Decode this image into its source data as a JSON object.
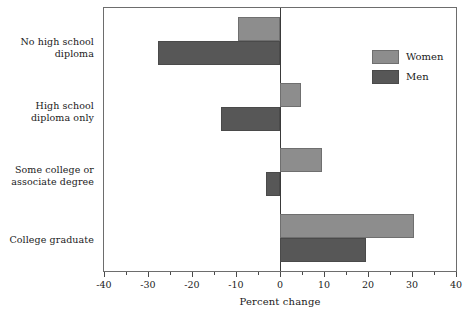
{
  "chart_data": {
    "type": "bar",
    "orientation": "horizontal",
    "title": "",
    "xlabel": "Percent change",
    "ylabel": "",
    "xlim": [
      -40,
      40
    ],
    "xticks": [
      -40,
      -30,
      -20,
      -10,
      0,
      10,
      20,
      30,
      40
    ],
    "xtick_labels": [
      "-40",
      "-30",
      "-20",
      "-10",
      "0",
      "10",
      "20",
      "30",
      "40"
    ],
    "grid": false,
    "zero_line": true,
    "legend_position": "upper right",
    "categories": [
      "No high school diploma",
      "High school diploma only",
      "Some college or associate degree",
      "College graduate"
    ],
    "series": [
      {
        "name": "Women",
        "color": "#8d8d8d",
        "values": [
          -9.5,
          4.7,
          9.5,
          30.5
        ]
      },
      {
        "name": "Men",
        "color": "#575757",
        "values": [
          -27.8,
          -13.5,
          -3.2,
          19.6
        ]
      }
    ]
  },
  "axis": {
    "x_title": "Percent change"
  },
  "categories": [
    {
      "line1": "No high school",
      "line2": "diploma"
    },
    {
      "line1": "High school",
      "line2": "diploma only"
    },
    {
      "line1": "Some college or",
      "line2": "associate degree"
    },
    {
      "line1": "College graduate",
      "line2": ""
    }
  ],
  "legend": {
    "items": [
      {
        "label": "Women",
        "color": "#8d8d8d"
      },
      {
        "label": "Men",
        "color": "#575757"
      }
    ]
  },
  "ticks": [
    {
      "label": "-40",
      "value": -40
    },
    {
      "label": "-30",
      "value": -30
    },
    {
      "label": "-20",
      "value": -20
    },
    {
      "label": "-10",
      "value": -10
    },
    {
      "label": "0",
      "value": 0
    },
    {
      "label": "10",
      "value": 10
    },
    {
      "label": "20",
      "value": 20
    },
    {
      "label": "30",
      "value": 30
    },
    {
      "label": "40",
      "value": 40
    }
  ]
}
